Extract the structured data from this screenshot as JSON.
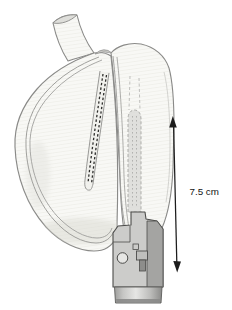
{
  "figure": {
    "alt": "Medical illustration of a surgical stapler forming a vertical staple line inside an opened stomach, with the staple-line length dimensioned by a double-headed arrow",
    "measurement_label": "7.5 cm",
    "parts": [
      "esophagus",
      "stomach-opened",
      "cut-edge",
      "staple-line",
      "stapler-anvil",
      "stapler-head",
      "stapler-shaft",
      "measurement-arrow"
    ],
    "colors": {
      "background": "#ffffff",
      "tissue_fill": "#f8f8f5",
      "tissue_hatch": "#eaeae4",
      "outline": "#8a8a88",
      "cut_edge": "#9b9b98",
      "staple_line": "#2e2e2c",
      "slit_fill": "#f1f1ed",
      "anvil_fill": "#dadad7",
      "device_body": "#ccccca",
      "device_dark": "#a4a4a2",
      "device_outline": "#4c4c4a",
      "arrow": "#1c1c1c",
      "label_text": "#141414"
    }
  },
  "canvas": {
    "width": 232,
    "height": 310
  }
}
